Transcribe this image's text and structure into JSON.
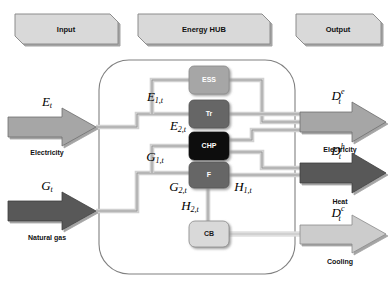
{
  "diagram": {
    "title": "Energy HUB",
    "banners": [
      {
        "id": "input",
        "label": "Input"
      },
      {
        "id": "hub",
        "label": "Energy HUB"
      },
      {
        "id": "output",
        "label": "Output"
      }
    ],
    "inputs": [
      {
        "id": "electricity-in",
        "symbol": "E",
        "sub": "t",
        "sup": "",
        "caption": "Electricity",
        "color": "#a6a6a6"
      },
      {
        "id": "gas-in",
        "symbol": "G",
        "sub": "t",
        "sup": "",
        "caption": "Natural gas",
        "color": "#595959"
      }
    ],
    "outputs": [
      {
        "id": "electricity-out",
        "symbol": "D",
        "sub": "t",
        "sup": "e",
        "caption": "Electricity",
        "color": "#a6a6a6"
      },
      {
        "id": "heat-out",
        "symbol": "D",
        "sub": "t",
        "sup": "h",
        "caption": "Heat",
        "color": "#595959"
      },
      {
        "id": "cooling-out",
        "symbol": "D",
        "sub": "t",
        "sup": "c",
        "caption": "Cooling",
        "color": "#cccccc"
      }
    ],
    "components": [
      {
        "id": "ess",
        "label": "ESS",
        "fill": "#a6a6a6",
        "text": "light"
      },
      {
        "id": "tr",
        "label": "Tr",
        "fill": "#666666",
        "text": "dark"
      },
      {
        "id": "chp",
        "label": "CHP",
        "fill": "#0d0d0d",
        "text": "dark"
      },
      {
        "id": "f",
        "label": "F",
        "fill": "#666666",
        "text": "dark"
      },
      {
        "id": "cb",
        "label": "CB",
        "fill": "#d9d9d9",
        "text": "light"
      }
    ],
    "flow_labels": [
      {
        "id": "e1t",
        "symbol": "E",
        "sub": "1,t"
      },
      {
        "id": "e2t",
        "symbol": "E",
        "sub": "2,t"
      },
      {
        "id": "g1t",
        "symbol": "G",
        "sub": "1,t"
      },
      {
        "id": "g2t",
        "symbol": "G",
        "sub": "2,t"
      },
      {
        "id": "h1t",
        "symbol": "H",
        "sub": "1,t"
      },
      {
        "id": "h2t",
        "symbol": "H",
        "sub": "2,t"
      }
    ],
    "colors": {
      "banner_fill": "#d9d9d9",
      "banner_stroke": "#8c8c8c",
      "hub_stroke": "#808080",
      "pipe_stroke": "#8c8c8c",
      "pipe_fill": "#d0d0d0",
      "cool_pipe": "#dcdcdc",
      "background": "#ffffff"
    }
  }
}
